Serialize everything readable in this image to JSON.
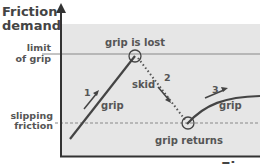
{
  "axis": {
    "y_title_line1": "Friction",
    "y_title_line2": "demand"
  },
  "levels": {
    "limit_line1": "limit",
    "limit_line2": "of grip",
    "slip_line1": "slipping",
    "slip_line2": "friction"
  },
  "phases": [
    {
      "number": "1",
      "label": "grip"
    },
    {
      "number": "2",
      "label": "skid"
    },
    {
      "number": "3",
      "label": "grip"
    }
  ],
  "events": {
    "lost": "grip is lost",
    "returns": "grip returns"
  },
  "caption_partial": "Fi",
  "colors": {
    "shade": "#e4e4e4",
    "line": "#444444",
    "text": "#555555"
  }
}
